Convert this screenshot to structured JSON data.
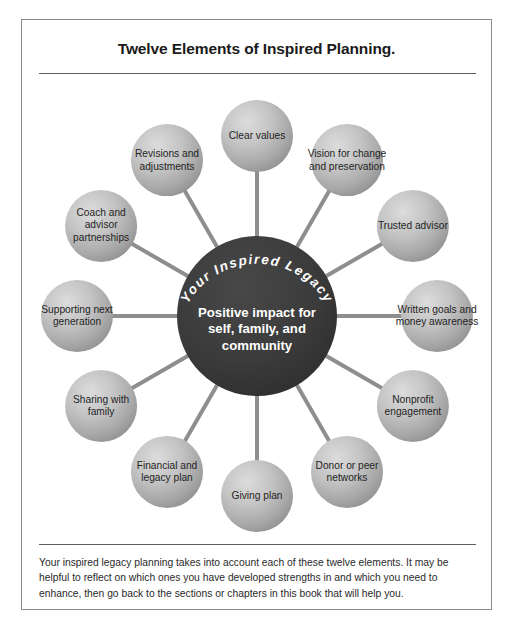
{
  "page": {
    "title": "Twelve Elements of Inspired Planning.",
    "caption": "Your inspired legacy planning takes into account each of these twelve elements. It may be helpful to reflect on which ones you have developed strengths in and which you need to enhance, then go back to the sections or chapters in this book that will help you."
  },
  "hub": {
    "arc_text": "Your Inspired Legacy",
    "label": "Positive impact for self, family, and community",
    "fill_color": "#3a3a3a",
    "text_color": "#ffffff"
  },
  "colors": {
    "node_fill_light": "#d4d4d4",
    "node_fill_dark": "#9b9b9b",
    "spoke": "#8e8e8e",
    "frame_border": "#8d8d8d",
    "rule": "#5c5c5c",
    "text": "#1f1f1f"
  },
  "diagram": {
    "type": "radial-hub-and-spoke",
    "node_count": 12,
    "nodes": [
      {
        "label": "Clear values",
        "angle_deg": -90,
        "position": "top"
      },
      {
        "label": "Vision for change and preservation",
        "angle_deg": -60,
        "position": "top-right"
      },
      {
        "label": "Trusted advisor",
        "angle_deg": -30,
        "position": "upper-right"
      },
      {
        "label": "Written goals and money awareness",
        "angle_deg": 0,
        "position": "right"
      },
      {
        "label": "Nonprofit engagement",
        "angle_deg": 30,
        "position": "lower-right"
      },
      {
        "label": "Donor or peer networks",
        "angle_deg": 60,
        "position": "bottom-right"
      },
      {
        "label": "Giving plan",
        "angle_deg": 90,
        "position": "bottom"
      },
      {
        "label": "Financial and legacy plan",
        "angle_deg": 120,
        "position": "bottom-left"
      },
      {
        "label": "Sharing with family",
        "angle_deg": 150,
        "position": "lower-left"
      },
      {
        "label": "Supporting next generation",
        "angle_deg": 180,
        "position": "left"
      },
      {
        "label": "Coach and advisor partnerships",
        "angle_deg": 210,
        "position": "upper-left"
      },
      {
        "label": "Revisions and adjustments",
        "angle_deg": 240,
        "position": "top-left"
      }
    ]
  }
}
